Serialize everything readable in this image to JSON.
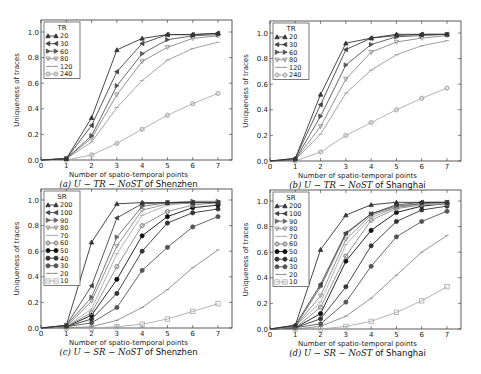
{
  "chart_data": [
    {
      "id": "a",
      "type": "line",
      "title": "",
      "caption": "(a) U − TR − NoST of Shenzhen",
      "caption_parts": {
        "prefix": "(a) ",
        "math": "U − TR − NoST",
        "suffix": " of Shenzhen"
      },
      "xlabel": "Number of spatio-temporal points",
      "ylabel": "Uniqueness of traces",
      "xlim": [
        0,
        7.5
      ],
      "ylim": [
        0,
        1.1
      ],
      "xticks": [
        0,
        1,
        2,
        3,
        4,
        5,
        6,
        7
      ],
      "yticks": [
        "0.0",
        "0.2",
        "0.4",
        "0.6",
        "0.8",
        "1.0"
      ],
      "grid": false,
      "legend_title": "TR",
      "legend_position": "upper left",
      "x": [
        0,
        1,
        2,
        3,
        4,
        5,
        6,
        7
      ],
      "series": [
        {
          "name": "20",
          "marker": "triangle-up",
          "color": "#333333",
          "values": [
            0,
            0.01,
            0.33,
            0.86,
            0.95,
            0.98,
            0.98,
            0.99
          ]
        },
        {
          "name": "30",
          "marker": "triangle-left",
          "color": "#444444",
          "values": [
            0,
            0.01,
            0.27,
            0.69,
            0.91,
            0.98,
            0.98,
            0.99
          ]
        },
        {
          "name": "60",
          "marker": "triangle-right",
          "color": "#555555",
          "values": [
            0,
            0.01,
            0.19,
            0.58,
            0.83,
            0.94,
            0.97,
            0.98
          ]
        },
        {
          "name": "80",
          "marker": "triangle-down",
          "color": "#888888",
          "values": [
            0,
            0.01,
            0.17,
            0.51,
            0.77,
            0.88,
            0.95,
            0.97
          ]
        },
        {
          "name": "120",
          "marker": "tri-line",
          "color": "#999999",
          "values": [
            0,
            0.01,
            0.14,
            0.41,
            0.62,
            0.78,
            0.87,
            0.92
          ]
        },
        {
          "name": "240",
          "marker": "diamond-circle",
          "color": "#aaaaaa",
          "values": [
            0,
            0.0,
            0.04,
            0.13,
            0.24,
            0.35,
            0.44,
            0.52
          ]
        }
      ]
    },
    {
      "id": "b",
      "type": "line",
      "title": "",
      "caption": "(b) U − TR − NoST of Shanghai",
      "caption_parts": {
        "prefix": "(b) ",
        "math": "U − TR − NoST",
        "suffix": " of Shanghai"
      },
      "xlabel": "Number of spatio-temporal points",
      "ylabel": "Uniqueness of traces",
      "xlim": [
        0,
        7.5
      ],
      "ylim": [
        0,
        1.1
      ],
      "xticks": [
        0,
        1,
        2,
        3,
        4,
        5,
        6,
        7
      ],
      "yticks": [
        "0.0",
        "0.2",
        "0.4",
        "0.6",
        "0.8",
        "1.0"
      ],
      "grid": false,
      "legend_title": "TR",
      "legend_position": "upper left",
      "x": [
        0,
        1,
        2,
        3,
        4,
        5,
        6,
        7
      ],
      "series": [
        {
          "name": "20",
          "marker": "triangle-up",
          "color": "#333333",
          "values": [
            0,
            0.02,
            0.52,
            0.92,
            0.96,
            0.99,
            0.99,
            0.99
          ]
        },
        {
          "name": "30",
          "marker": "triangle-left",
          "color": "#444444",
          "values": [
            0,
            0.02,
            0.44,
            0.87,
            0.96,
            0.98,
            0.99,
            0.99
          ]
        },
        {
          "name": "60",
          "marker": "triangle-right",
          "color": "#555555",
          "values": [
            0,
            0.01,
            0.35,
            0.75,
            0.91,
            0.97,
            0.98,
            0.99
          ]
        },
        {
          "name": "80",
          "marker": "triangle-down",
          "color": "#888888",
          "values": [
            0,
            0.01,
            0.27,
            0.64,
            0.85,
            0.93,
            0.96,
            0.98
          ]
        },
        {
          "name": "120",
          "marker": "tri-line",
          "color": "#999999",
          "values": [
            0,
            0.01,
            0.21,
            0.53,
            0.71,
            0.83,
            0.9,
            0.94
          ]
        },
        {
          "name": "240",
          "marker": "diamond-circle",
          "color": "#aaaaaa",
          "values": [
            0,
            0.0,
            0.07,
            0.2,
            0.3,
            0.4,
            0.49,
            0.57
          ]
        }
      ]
    },
    {
      "id": "c",
      "type": "line",
      "title": "",
      "caption": "(c) U − SR − NoST of Shenzhen",
      "caption_parts": {
        "prefix": "(c) ",
        "math": "U − SR − NoST",
        "suffix": " of Shenzhen"
      },
      "xlabel": "Number of spatio-temporal points",
      "ylabel": "Uniqueness of traces",
      "xlim": [
        0,
        7.5
      ],
      "ylim": [
        0,
        1.1
      ],
      "xticks": [
        0,
        1,
        2,
        3,
        4,
        5,
        6,
        7
      ],
      "yticks": [
        "0.0",
        "0.2",
        "0.4",
        "0.6",
        "0.8",
        "1.0"
      ],
      "grid": false,
      "legend_title": "SR",
      "legend_position": "upper left",
      "x": [
        0,
        1,
        2,
        3,
        4,
        5,
        6,
        7
      ],
      "series": [
        {
          "name": "200",
          "marker": "triangle-up",
          "color": "#333333",
          "values": [
            0,
            0.02,
            0.67,
            0.97,
            0.98,
            0.98,
            0.98,
            0.98
          ]
        },
        {
          "name": "100",
          "marker": "triangle-left",
          "color": "#444444",
          "values": [
            0,
            0.02,
            0.33,
            0.86,
            0.97,
            0.98,
            0.98,
            0.98
          ]
        },
        {
          "name": "90",
          "marker": "triangle-right",
          "color": "#666666",
          "values": [
            0,
            0.02,
            0.24,
            0.71,
            0.95,
            0.98,
            0.99,
            0.99
          ]
        },
        {
          "name": "80",
          "marker": "triangle-down",
          "color": "#888888",
          "values": [
            0,
            0.01,
            0.21,
            0.64,
            0.92,
            0.97,
            0.98,
            0.98
          ]
        },
        {
          "name": "70",
          "marker": "tri-line",
          "color": "#aaaaaa",
          "values": [
            0,
            0.01,
            0.15,
            0.58,
            0.88,
            0.96,
            0.98,
            0.98
          ]
        },
        {
          "name": "60",
          "marker": "diamond-circle",
          "color": "#888888",
          "values": [
            0,
            0.01,
            0.12,
            0.48,
            0.8,
            0.91,
            0.96,
            0.98
          ]
        },
        {
          "name": "50",
          "marker": "hexagon",
          "color": "#111111",
          "values": [
            0,
            0.01,
            0.1,
            0.38,
            0.72,
            0.87,
            0.94,
            0.96
          ]
        },
        {
          "name": "40",
          "marker": "pentagon",
          "color": "#333333",
          "values": [
            0,
            0.01,
            0.07,
            0.27,
            0.6,
            0.82,
            0.9,
            0.93
          ]
        },
        {
          "name": "30",
          "marker": "octagon",
          "color": "#555555",
          "values": [
            0,
            0.01,
            0.04,
            0.16,
            0.45,
            0.63,
            0.79,
            0.87
          ]
        },
        {
          "name": "20",
          "marker": "plus-line",
          "color": "#888888",
          "values": [
            0,
            0.0,
            0.01,
            0.06,
            0.16,
            0.3,
            0.47,
            0.61
          ]
        },
        {
          "name": "10",
          "marker": "square",
          "color": "#aaaaaa",
          "values": [
            0,
            0.0,
            0.0,
            0.01,
            0.03,
            0.07,
            0.13,
            0.19
          ]
        }
      ]
    },
    {
      "id": "d",
      "type": "line",
      "title": "",
      "caption": "(d) U − SR − NoST of Shanghai",
      "caption_parts": {
        "prefix": "(d) ",
        "math": "U − SR − NoST",
        "suffix": " of Shanghai"
      },
      "xlabel": "Number of spatio-temporal points",
      "ylabel": "Uniqueness of traces",
      "xlim": [
        0,
        7.5
      ],
      "ylim": [
        0,
        1.1
      ],
      "xticks": [
        0,
        1,
        2,
        3,
        4,
        5,
        6,
        7
      ],
      "yticks": [
        "0.0",
        "0.2",
        "0.4",
        "0.6",
        "0.8",
        "1.0"
      ],
      "grid": false,
      "legend_title": "SR",
      "legend_position": "upper left",
      "x": [
        0,
        1,
        2,
        3,
        4,
        5,
        6,
        7
      ],
      "series": [
        {
          "name": "200",
          "marker": "triangle-up",
          "color": "#333333",
          "values": [
            0,
            0.03,
            0.62,
            0.89,
            0.97,
            0.99,
            0.99,
            0.99
          ]
        },
        {
          "name": "100",
          "marker": "triangle-left",
          "color": "#444444",
          "values": [
            0,
            0.03,
            0.35,
            0.75,
            0.9,
            0.97,
            0.99,
            0.99
          ]
        },
        {
          "name": "90",
          "marker": "triangle-right",
          "color": "#666666",
          "values": [
            0,
            0.02,
            0.33,
            0.74,
            0.9,
            0.96,
            0.98,
            0.99
          ]
        },
        {
          "name": "80",
          "marker": "triangle-down",
          "color": "#888888",
          "values": [
            0,
            0.02,
            0.26,
            0.7,
            0.89,
            0.95,
            0.98,
            0.99
          ]
        },
        {
          "name": "70",
          "marker": "tri-line",
          "color": "#aaaaaa",
          "values": [
            0,
            0.02,
            0.21,
            0.66,
            0.87,
            0.95,
            0.97,
            0.98
          ]
        },
        {
          "name": "60",
          "marker": "diamond-circle",
          "color": "#888888",
          "values": [
            0,
            0.01,
            0.17,
            0.57,
            0.85,
            0.94,
            0.97,
            0.98
          ]
        },
        {
          "name": "50",
          "marker": "hexagon",
          "color": "#111111",
          "values": [
            0,
            0.01,
            0.12,
            0.53,
            0.77,
            0.91,
            0.96,
            0.98
          ]
        },
        {
          "name": "40",
          "marker": "pentagon",
          "color": "#333333",
          "values": [
            0,
            0.01,
            0.08,
            0.33,
            0.65,
            0.84,
            0.93,
            0.96
          ]
        },
        {
          "name": "30",
          "marker": "octagon",
          "color": "#555555",
          "values": [
            0,
            0.01,
            0.04,
            0.21,
            0.49,
            0.72,
            0.84,
            0.92
          ]
        },
        {
          "name": "20",
          "marker": "plus-line",
          "color": "#888888",
          "values": [
            0,
            0.0,
            0.02,
            0.1,
            0.24,
            0.42,
            0.6,
            0.73
          ]
        },
        {
          "name": "10",
          "marker": "square",
          "color": "#aaaaaa",
          "values": [
            0,
            0.0,
            0.0,
            0.02,
            0.06,
            0.13,
            0.22,
            0.33
          ]
        }
      ]
    }
  ],
  "layout": {
    "panels": [
      {
        "id": "a",
        "frame": [
          41,
          20,
          232,
          160
        ],
        "x0": 41,
        "x7": 218,
        "y0": 160,
        "y1": 32
      },
      {
        "id": "b",
        "frame": [
          270,
          21,
          461,
          161
        ],
        "x0": 270,
        "x7": 447,
        "y0": 161,
        "y1": 33
      },
      {
        "id": "c",
        "frame": [
          41,
          189,
          232,
          328
        ],
        "x0": 41,
        "x7": 218,
        "y0": 328,
        "y1": 200
      },
      {
        "id": "d",
        "frame": [
          270,
          190,
          461,
          329
        ],
        "x0": 270,
        "x7": 447,
        "y0": 329,
        "y1": 201
      }
    ]
  }
}
